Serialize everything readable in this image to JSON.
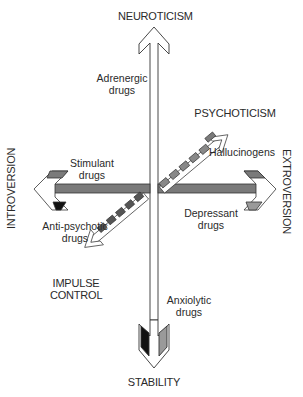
{
  "axes": {
    "top": "NEUROTICISM",
    "bottom": "STABILITY",
    "left": "INTROVERSION",
    "right": "EXTROVERSION",
    "diag_upper": "PSYCHOTICISM",
    "diag_lower_line1": "IMPULSE",
    "diag_lower_line2": "CONTROL"
  },
  "drug_labels": {
    "adrenergic": {
      "line1": "Adrenergic",
      "line2": "drugs"
    },
    "hallucinogens": {
      "line1": "Hallucinogens"
    },
    "stimulant": {
      "line1": "Stimulant",
      "line2": "drugs"
    },
    "depressant": {
      "line1": "Depressant",
      "line2": "drugs"
    },
    "antipsychotic": {
      "line1": "Anti-psychotic",
      "line2": "drugs"
    },
    "anxiolytic": {
      "line1": "Anxiolytic",
      "line2": "drugs"
    }
  },
  "colors": {
    "bar_gray": "#7a7a7a",
    "outline": "#333333",
    "dark": "#111111",
    "light_gray": "#9a9a9a"
  }
}
